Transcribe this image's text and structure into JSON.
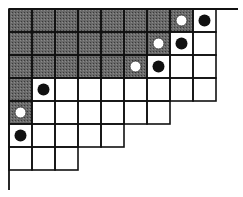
{
  "diagram": {
    "type": "young-diagram-with-markers",
    "cell_size": 23,
    "origin": [
      9,
      9
    ],
    "row_lengths": [
      9,
      9,
      9,
      9,
      7,
      5,
      3
    ],
    "shaded_cells": [
      [
        0,
        0
      ],
      [
        0,
        1
      ],
      [
        0,
        2
      ],
      [
        0,
        3
      ],
      [
        0,
        4
      ],
      [
        0,
        5
      ],
      [
        0,
        6
      ],
      [
        0,
        7
      ],
      [
        1,
        0
      ],
      [
        1,
        1
      ],
      [
        1,
        2
      ],
      [
        1,
        3
      ],
      [
        1,
        4
      ],
      [
        1,
        5
      ],
      [
        1,
        6
      ],
      [
        2,
        0
      ],
      [
        2,
        1
      ],
      [
        2,
        2
      ],
      [
        2,
        3
      ],
      [
        2,
        4
      ],
      [
        2,
        5
      ],
      [
        3,
        0
      ],
      [
        4,
        0
      ]
    ],
    "black_dots": [
      [
        0,
        8
      ],
      [
        1,
        7
      ],
      [
        2,
        6
      ],
      [
        3,
        1
      ],
      [
        5,
        0
      ]
    ],
    "white_dots": [
      [
        0,
        7
      ],
      [
        1,
        6
      ],
      [
        2,
        5
      ],
      [
        4,
        0
      ]
    ],
    "axis": {
      "top_extent_x": 238,
      "left_extent_y": 190
    },
    "colors": {
      "shade": "#5a5a5a",
      "line": "#111111",
      "dot": "#111111",
      "bg": "#ffffff"
    }
  }
}
